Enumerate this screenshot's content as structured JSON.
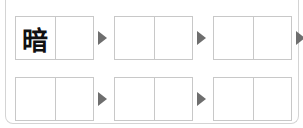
{
  "puzzle": {
    "rows": [
      {
        "words": [
          {
            "cells": [
              "暗",
              ""
            ]
          },
          {
            "cells": [
              "",
              ""
            ]
          },
          {
            "cells": [
              "",
              ""
            ]
          }
        ],
        "trailing_arrow": true
      },
      {
        "words": [
          {
            "cells": [
              "",
              ""
            ]
          },
          {
            "cells": [
              "",
              ""
            ]
          },
          {
            "cells": [
              "",
              ""
            ]
          }
        ],
        "trailing_arrow": false
      }
    ],
    "arrow_color": "#6e6e6e",
    "border_color": "#c8c8c8"
  }
}
